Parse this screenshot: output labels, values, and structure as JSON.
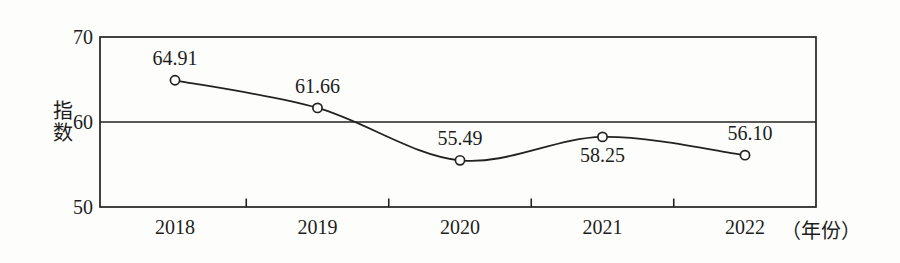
{
  "chart_data": {
    "type": "line",
    "title": "",
    "ylabel": "指数",
    "xlabel": "（年份）",
    "categories": [
      "2018",
      "2019",
      "2020",
      "2021",
      "2022"
    ],
    "values": [
      64.91,
      61.66,
      55.49,
      58.25,
      56.1
    ],
    "point_labels": [
      "64.91",
      "61.66",
      "55.49",
      "58.25",
      "56.10"
    ],
    "label_positions": [
      "above",
      "above",
      "above",
      "below",
      "above"
    ],
    "y_tick_values": [
      70,
      60,
      50
    ],
    "y_tick_labels": [
      "70",
      "60",
      "50"
    ],
    "ylim": [
      50,
      70
    ],
    "reference_line_y": 60,
    "grid": "single horizontal reference line at y=60",
    "legend": "none",
    "marker": "open-circle",
    "line_color": "#222222",
    "background_color": "#fdfdfb"
  }
}
